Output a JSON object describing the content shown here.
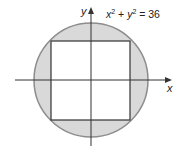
{
  "figure": {
    "equation": {
      "x_var": "x",
      "y_var": "y",
      "exp": "2",
      "plus": " + ",
      "equals": " = 36",
      "full_text": "x² + y² = 36"
    },
    "axes": {
      "x_label": "x",
      "y_label": "y"
    },
    "shapes": {
      "circle": {
        "equation": "x^2 + y^2 = 36",
        "radius": 6,
        "fill": "#d9d9d9",
        "stroke": "#8c8c8c"
      },
      "square": {
        "description": "inscribed square",
        "fill": "#ffffff",
        "stroke": "#333333"
      }
    },
    "colors": {
      "shaded_region": "#d9d9d9",
      "circle_stroke": "#8c8c8c",
      "line": "#333333"
    }
  }
}
